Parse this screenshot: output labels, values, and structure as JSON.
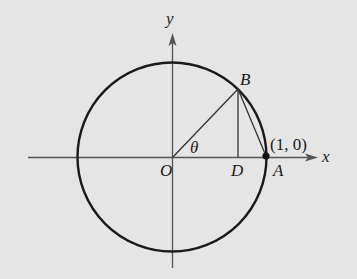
{
  "diagram": {
    "colors": {
      "background": "#e5e5e5",
      "stroke": "#1a1a1a"
    },
    "axes": {
      "x_label": "x",
      "y_label": "y"
    },
    "points": {
      "origin": "O",
      "b": "B",
      "d": "D",
      "a": "A",
      "a_coords": "(1, 0)"
    },
    "angle_label": "θ"
  }
}
